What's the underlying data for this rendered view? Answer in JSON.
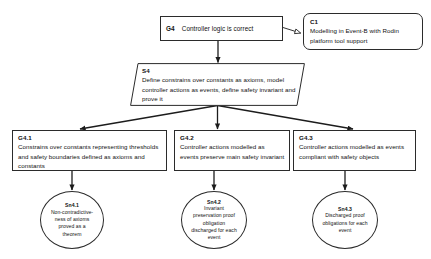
{
  "diagram": {
    "type": "gsn-assurance-case",
    "title": "",
    "background_color": "#ffffff",
    "stroke_color": "#2b2b2b",
    "text_color": "#111111"
  },
  "nodes": {
    "g4": {
      "id": "G4",
      "kind": "goal",
      "text": "Controller logic is correct"
    },
    "c1": {
      "id": "C1",
      "kind": "context",
      "text": "Modelling in Event-B with Rodin platform tool support"
    },
    "s4": {
      "id": "S4",
      "kind": "strategy",
      "text": "Define constrains over constants as axioms, model controller actions as events, define safety invariant and prove it"
    },
    "g41": {
      "id": "G4.1",
      "kind": "goal",
      "text": "Constrains over constants representing thresholds and safety boundaries defined as axioms and constants"
    },
    "g42": {
      "id": "G4.2",
      "kind": "goal",
      "text": "Controller actions modelled as events preserve main safety invariant"
    },
    "g43": {
      "id": "G4.3",
      "kind": "goal",
      "text": "Controller actions modelled as events compliant with safety objects"
    },
    "sn41": {
      "id": "Sn4.1",
      "kind": "solution",
      "text": "Non-contradictive-ness of axioms proved as a theorem"
    },
    "sn42": {
      "id": "Sn4.2",
      "kind": "solution",
      "text": "Invariant preservation proof obligation discharged for each event"
    },
    "sn43": {
      "id": "Sn4.3",
      "kind": "solution",
      "text": "Discharged proof obligations for each event"
    }
  },
  "connectors": [
    {
      "name": "g4-to-c1",
      "from": "G4",
      "to": "C1",
      "arrow": "hollow"
    },
    {
      "name": "g4-to-s4",
      "from": "G4",
      "to": "S4",
      "arrow": "solid"
    },
    {
      "name": "s4-to-g41",
      "from": "S4",
      "to": "G4.1",
      "arrow": "solid"
    },
    {
      "name": "s4-to-g42",
      "from": "S4",
      "to": "G4.2",
      "arrow": "solid"
    },
    {
      "name": "s4-to-g43",
      "from": "S4",
      "to": "G4.3",
      "arrow": "solid"
    },
    {
      "name": "g41-to-sn41",
      "from": "G4.1",
      "to": "Sn4.1",
      "arrow": "solid"
    },
    {
      "name": "g42-to-sn42",
      "from": "G4.2",
      "to": "Sn4.2",
      "arrow": "solid"
    },
    {
      "name": "g43-to-sn43",
      "from": "G4.3",
      "to": "Sn4.3",
      "arrow": "solid"
    }
  ]
}
